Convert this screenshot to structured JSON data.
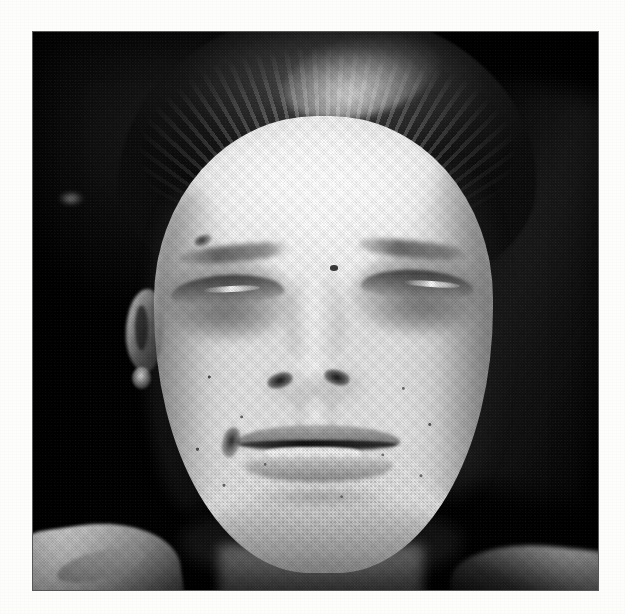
{
  "page": {
    "background_color": "#fdfdfc",
    "media": "scanned printed page",
    "caption": "",
    "margin_text": ""
  },
  "photo": {
    "alt": "Black-and-white clinical photograph: frontal view of a young adult man's face showing marked bilateral periorbital swelling with both eyes closed, generalized facial edema, swollen lips with mouth slightly open, and scattered papular skin lesions on the cheeks.",
    "frame": {
      "x": 33,
      "y": 32,
      "width": 565,
      "height": 558
    },
    "tone": "monochrome halftone print",
    "colors": {
      "backdrop_dark": "#0d0d0d",
      "skin_highlight": "#f7f7f7",
      "skin_midtone": "#d2d2d2",
      "shadow": "#3a3a3a",
      "paper_white": "#fdfdfc"
    },
    "subject_features": [
      {
        "name": "hair",
        "description": "dark hair swept back off a high forehead"
      },
      {
        "name": "forehead",
        "description": "broad, brightly lit, overexposed highlight"
      },
      {
        "name": "eyebrow-left",
        "description": "dark brow, partly obscured by swelling"
      },
      {
        "name": "eyebrow-right",
        "description": "dark brow angled upward laterally"
      },
      {
        "name": "eye-left",
        "description": "closed, marked periorbital edema"
      },
      {
        "name": "eye-right",
        "description": "closed, marked periorbital edema"
      },
      {
        "name": "brow-lesion",
        "description": "small dark crusted lesion above left brow"
      },
      {
        "name": "glabellar-mole",
        "description": "small dark mole between the brows"
      },
      {
        "name": "nose",
        "description": "broad nose, nostrils in shadow"
      },
      {
        "name": "lips",
        "description": "swollen lips, mouth slightly open, upper teeth visible"
      },
      {
        "name": "mouth-corner-crust",
        "description": "dark crusting at the left oral commissure"
      },
      {
        "name": "cheeks",
        "description": "full, rounded cheeks with scattered papular lesions and stubble"
      },
      {
        "name": "ear-left",
        "description": "left ear outlined against the dark backdrop"
      },
      {
        "name": "collar",
        "description": "light shirt collar at lower left"
      },
      {
        "name": "shoulder",
        "description": "lit shoulder contour at lower right"
      },
      {
        "name": "backdrop",
        "description": "dark studio background with a faint lighter diagonal band at upper right"
      }
    ]
  }
}
